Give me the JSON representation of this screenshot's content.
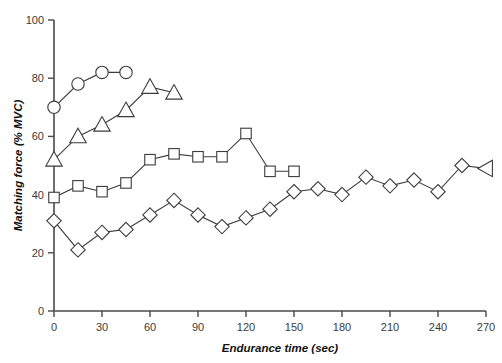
{
  "chart_data": {
    "type": "line",
    "title": "",
    "xlabel": "Endurance time (sec)",
    "ylabel": "Matching force (% MVC)",
    "xlim": [
      0,
      270
    ],
    "ylim": [
      0,
      100
    ],
    "xticks": [
      0,
      30,
      60,
      90,
      120,
      150,
      180,
      210,
      240,
      270
    ],
    "yticks": [
      0,
      20,
      40,
      60,
      80,
      100
    ],
    "xtick_labels": [
      "0",
      "30",
      "60",
      "90",
      "120",
      "150",
      "180",
      "210",
      "240",
      "270"
    ],
    "ytick_labels": [
      "0",
      "20",
      "40",
      "60",
      "80",
      "100"
    ],
    "grid": false,
    "legend": "none",
    "series": [
      {
        "name": "circle-series",
        "marker": "circle",
        "x": [
          0,
          15,
          30,
          45
        ],
        "values": [
          70,
          78,
          82,
          82
        ]
      },
      {
        "name": "triangle-series",
        "marker": "triangle-up",
        "x": [
          0,
          15,
          30,
          45,
          60,
          75
        ],
        "values": [
          52,
          60,
          64,
          69,
          77,
          75
        ]
      },
      {
        "name": "square-series",
        "marker": "square",
        "x": [
          0,
          15,
          30,
          45,
          60,
          75,
          90,
          105,
          120,
          135,
          150
        ],
        "values": [
          39,
          43,
          41,
          44,
          52,
          54,
          53,
          53,
          61,
          48,
          48
        ]
      },
      {
        "name": "diamond-series",
        "marker": "diamond",
        "x": [
          0,
          15,
          30,
          45,
          60,
          75,
          90,
          105,
          120,
          135,
          150,
          165,
          180,
          195,
          210,
          225,
          240,
          255,
          270
        ],
        "values": [
          31,
          21,
          27,
          28,
          33,
          38,
          33,
          29,
          32,
          35,
          41,
          42,
          40,
          46,
          43,
          45,
          41,
          50,
          49
        ],
        "end_marker": "triangle-left"
      }
    ]
  },
  "axes": {
    "x_title": "Endurance time (sec)",
    "y_title": "Matching force (% MVC)"
  }
}
